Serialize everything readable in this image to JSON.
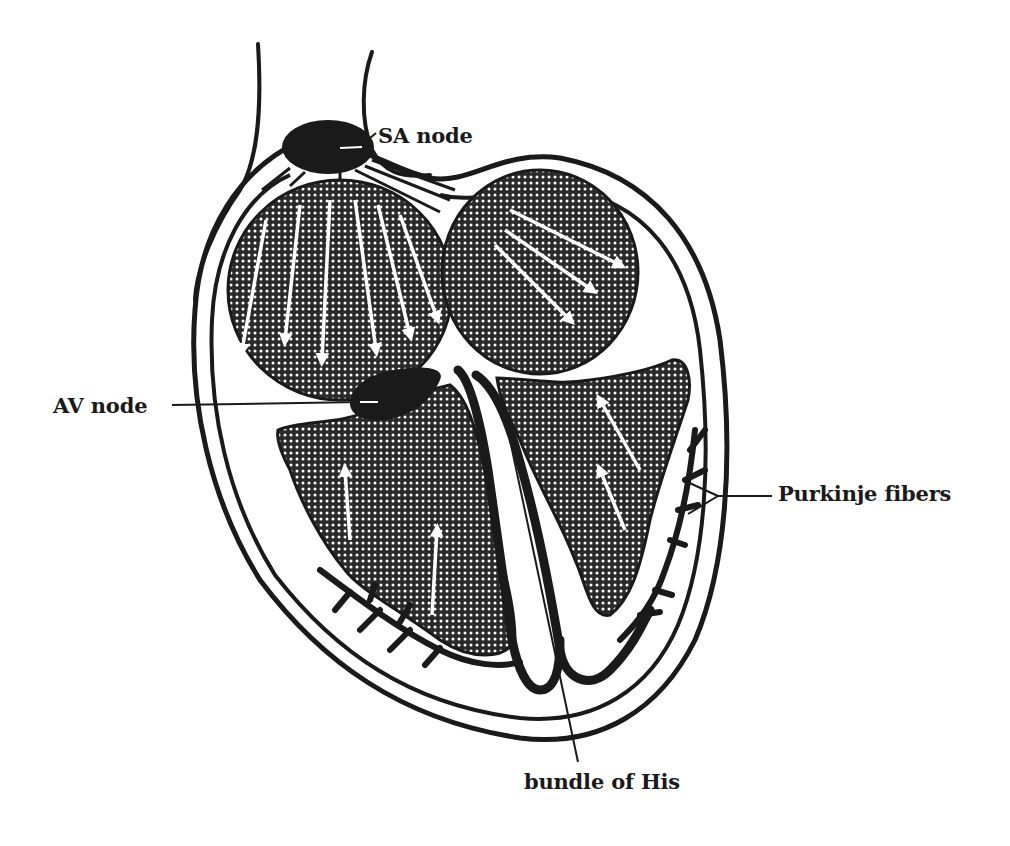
{
  "figure": {
    "labels": {
      "sa_node": "SA node",
      "av_node": "AV node",
      "purkinje_fibers": "Purkinje fibers",
      "bundle_of_his": "bundle of His"
    },
    "colors": {
      "ink": "#1a1a1a",
      "background": "#ffffff",
      "stipple": "#2a2a2a"
    }
  }
}
